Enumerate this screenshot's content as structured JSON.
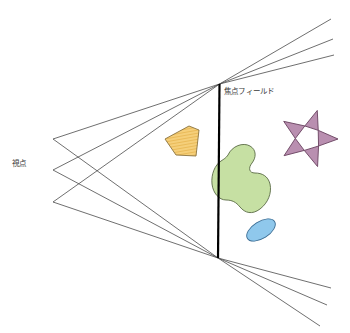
{
  "diagram": {
    "background_color": "#ffffff",
    "labels": {
      "viewpoint": "視点",
      "focal_field": "焦点フィールド"
    },
    "colors": {
      "ray_stroke": "#4a4a4a",
      "axis_stroke": "#000000",
      "orange_fill": "#f5cf7a",
      "orange_stroke": "#8a7340",
      "orange_hatch": "#e0a93c",
      "green_fill": "#c6e0a3",
      "green_stroke": "#5a6b45",
      "blue_fill": "#8fc8ec",
      "blue_stroke": "#3b6d94",
      "purple_fill": "#b98fb0",
      "purple_stroke": "#6d4663",
      "text_color": "#3a3a3a"
    },
    "focal_line": {
      "name": "focal-field-axis",
      "x1": 219.5,
      "y1": 84,
      "x2": 218.0,
      "y2": 258,
      "stroke_width": 2.2
    },
    "viewpoints": [
      {
        "x": 53,
        "y": 139
      },
      {
        "x": 53,
        "y": 170
      },
      {
        "x": 53,
        "y": 202
      }
    ],
    "convergence_points": {
      "top": {
        "x": 219.5,
        "y": 84
      },
      "bottom": {
        "x": 218.0,
        "y": 258
      }
    },
    "rays_left": [
      {
        "name": "ray-vp1-top",
        "x1": 53,
        "y1": 139,
        "x2": 219.5,
        "y2": 84
      },
      {
        "name": "ray-vp2-top",
        "x1": 53,
        "y1": 170,
        "x2": 219.5,
        "y2": 84
      },
      {
        "name": "ray-vp3-top",
        "x1": 53,
        "y1": 202,
        "x2": 219.5,
        "y2": 84
      },
      {
        "name": "ray-vp1-bottom",
        "x1": 53,
        "y1": 139,
        "x2": 218.0,
        "y2": 258
      },
      {
        "name": "ray-vp2-bottom",
        "x1": 53,
        "y1": 170,
        "x2": 218.0,
        "y2": 258
      },
      {
        "name": "ray-vp3-bottom",
        "x1": 53,
        "y1": 202,
        "x2": 218.0,
        "y2": 258
      }
    ],
    "rays_right_top": [
      {
        "name": "ray-top-upper",
        "x1": 219.5,
        "y1": 84,
        "x2": 331,
        "y2": 19
      },
      {
        "name": "ray-top-middle",
        "x1": 219.5,
        "y1": 84,
        "x2": 333,
        "y2": 39
      },
      {
        "name": "ray-top-lower",
        "x1": 219.5,
        "y1": 84,
        "x2": 334,
        "y2": 55
      }
    ],
    "rays_right_bottom": [
      {
        "name": "ray-bottom-upper",
        "x1": 218.0,
        "y1": 258,
        "x2": 331,
        "y2": 288
      },
      {
        "name": "ray-bottom-middle",
        "x1": 218.0,
        "y1": 258,
        "x2": 327,
        "y2": 305
      },
      {
        "name": "ray-bottom-lower",
        "x1": 218.0,
        "y1": 258,
        "x2": 320,
        "y2": 326
      }
    ],
    "shapes": [
      {
        "name": "orange-quadrilateral",
        "kind": "polygon",
        "points": "165,139 189,126 199,130 196,156 176,155",
        "fill": "#f5cf7a",
        "stroke": "#8a7340",
        "hatched": true
      },
      {
        "name": "green-blob",
        "kind": "path",
        "fill": "#c6e0a3",
        "stroke": "#5a6b45"
      },
      {
        "name": "blue-ellipse",
        "kind": "ellipse",
        "cx": 261,
        "cy": 230,
        "rx": 16,
        "ry": 8.5,
        "rotation": -32,
        "fill": "#8fc8ec",
        "stroke": "#3b6d94"
      },
      {
        "name": "purple-star",
        "kind": "star",
        "points": 5,
        "cx": 308,
        "cy": 139,
        "outer_radius": 30,
        "inner_radius": 12,
        "rotation": 18,
        "fill": "#b98fb0",
        "stroke": "#6d4663"
      }
    ]
  }
}
